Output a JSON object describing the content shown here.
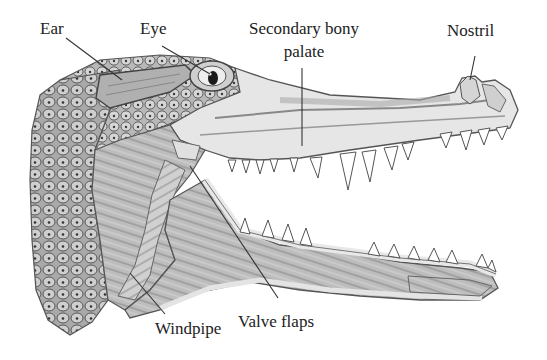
{
  "diagram": {
    "labels": [
      {
        "id": "ear",
        "text": "Ear"
      },
      {
        "id": "eye",
        "text": "Eye"
      },
      {
        "id": "secondary-bony-palate",
        "text_line1": "Secondary bony",
        "text_line2": "palate"
      },
      {
        "id": "nostril",
        "text": "Nostril"
      },
      {
        "id": "windpipe",
        "text": "Windpipe"
      },
      {
        "id": "valve-flaps",
        "text": "Valve flaps"
      }
    ]
  },
  "colors": {
    "background": "#ffffff",
    "label_text": "#222222",
    "leader_line": "#333333",
    "scales_dark": "#6b6b6b",
    "scales_mid": "#9a9a9a",
    "tissue_light": "#e4e4e4",
    "tissue_mid": "#c8c8c8",
    "muscle": "#a8a8a8",
    "teeth": "#ffffff"
  }
}
